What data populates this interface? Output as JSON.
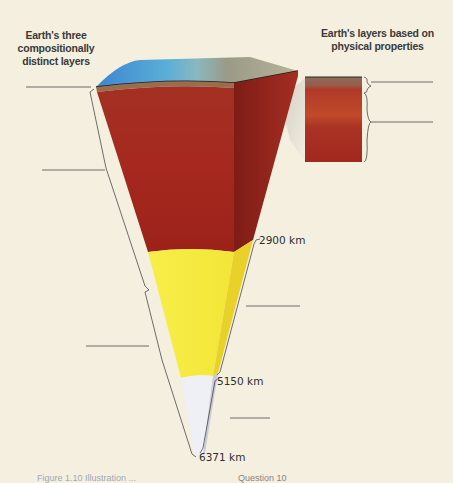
{
  "headings": {
    "compositional": "Earth's three compositionally distinct layers",
    "physical": "Earth's layers based on physical properties"
  },
  "depth_labels": {
    "core_mantle_boundary": "2900 km",
    "inner_outer_core_boundary": "5150 km",
    "center": "6371 km"
  },
  "caption": {
    "left": "Figure 1.10 Illustration ...",
    "right": "Question 10"
  },
  "layers": [
    {
      "name": "crust",
      "color": "#8a6a4a"
    },
    {
      "name": "mantle",
      "color": "#a82a1e"
    },
    {
      "name": "outer-core",
      "color": "#f4ea3c"
    },
    {
      "name": "inner-core",
      "color": "#eef0f4"
    }
  ],
  "blank_label_lines": {
    "left": [
      "crust",
      "mantle",
      "core"
    ],
    "right": [
      "lithosphere",
      "asthenosphere",
      "outer core",
      "inner core"
    ]
  },
  "colors": {
    "background": "#f5efdf",
    "ocean": "#4aa0d8",
    "land": "#9a9684",
    "line": "#3a3a3a"
  }
}
